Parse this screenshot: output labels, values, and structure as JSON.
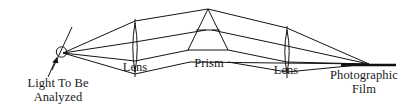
{
  "figure": {
    "type": "optical-ray-diagram",
    "background_color": "#ffffff",
    "line_color": "#141414",
    "text_color": "#1a1a1a"
  },
  "labels": {
    "light_source_line1": "Light To Be",
    "light_source_line2": "Analyzed",
    "lens_left": "Lens",
    "prism": "Prism",
    "lens_right": "Lens",
    "film_line1": "Photographic",
    "film_line2": "Film"
  },
  "components": {
    "slit": {
      "name": "entrance-slit",
      "center_x": 61.5,
      "center_y": 52,
      "radius": 5.2,
      "bar_x1": 52,
      "bar_y1": 70,
      "bar_x2": 72,
      "bar_y2": 28
    },
    "source_arrow": {
      "name": "incoming-light-arrow",
      "tail_x": 48,
      "tail_y": 76,
      "tip_x": 57,
      "tip_y": 58
    },
    "lens_left": {
      "name": "collimating-lens",
      "center_x": 135,
      "top_y": 23,
      "bottom_y": 72,
      "bulge": 4.2,
      "tick_top_y": 19,
      "tick_bottom_y": 76
    },
    "prism": {
      "name": "dispersing-prism",
      "apex_x": 208,
      "apex_y": 9,
      "base_left_x": 188,
      "base_right_x": 228,
      "base_y": 50,
      "mid_chord_y": 30
    },
    "lens_right": {
      "name": "focusing-lens",
      "center_x": 287,
      "top_y": 30,
      "bottom_y": 73,
      "bulge": 4.2,
      "tick_top_y": 26,
      "tick_bottom_y": 77
    },
    "film": {
      "name": "photographic-film",
      "x1": 341,
      "y1": 65,
      "x2": 396,
      "y2": 65
    }
  },
  "ray_bundles": {
    "source_to_lens_left": [
      {
        "x1": 63,
        "y1": 53,
        "x2": 135,
        "y2": 21
      },
      {
        "x1": 63,
        "y1": 53,
        "x2": 135,
        "y2": 42
      },
      {
        "x1": 63,
        "y1": 53,
        "x2": 135,
        "y2": 61
      },
      {
        "x1": 63,
        "y1": 53,
        "x2": 135,
        "y2": 74
      }
    ],
    "lens_left_to_prism": [
      {
        "x1": 135,
        "y1": 21,
        "x2": 208,
        "y2": 9
      },
      {
        "x1": 135,
        "y1": 42,
        "x2": 205,
        "y2": 30
      },
      {
        "x1": 135,
        "y1": 61,
        "x2": 188,
        "y2": 50
      },
      {
        "x1": 135,
        "y1": 74,
        "x2": 190,
        "y2": 62
      }
    ],
    "prism_to_lens_right": [
      {
        "x1": 208,
        "y1": 9,
        "x2": 287,
        "y2": 28
      },
      {
        "x1": 211,
        "y1": 30,
        "x2": 287,
        "y2": 46
      },
      {
        "x1": 228,
        "y1": 50,
        "x2": 287,
        "y2": 62
      },
      {
        "x1": 228,
        "y1": 62,
        "x2": 287,
        "y2": 72
      }
    ],
    "lens_right_to_film": [
      {
        "x1": 287,
        "y1": 28,
        "x2": 369,
        "y2": 64
      },
      {
        "x1": 287,
        "y1": 46,
        "x2": 369,
        "y2": 64
      },
      {
        "x1": 287,
        "y1": 62,
        "x2": 369,
        "y2": 64
      },
      {
        "x1": 287,
        "y1": 72,
        "x2": 369,
        "y2": 64
      }
    ],
    "envelope_upper": [
      {
        "x1": 63,
        "y1": 52,
        "x2": 208,
        "y2": 9
      },
      {
        "x1": 208,
        "y1": 9,
        "x2": 369,
        "y2": 64
      }
    ],
    "envelope_lower": [
      {
        "x1": 63,
        "y1": 54,
        "x2": 190,
        "y2": 62
      },
      {
        "x1": 190,
        "y1": 62,
        "x2": 369,
        "y2": 64
      }
    ]
  }
}
